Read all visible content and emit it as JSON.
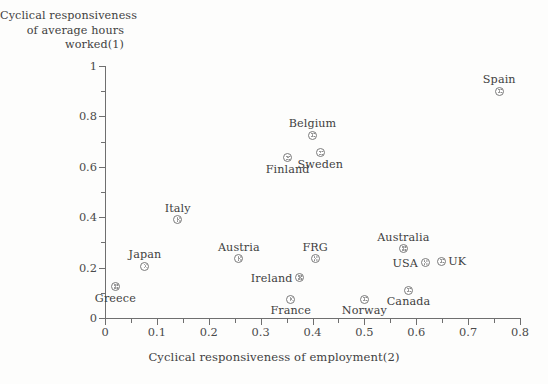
{
  "chart_data": {
    "type": "scatter",
    "title": "",
    "ylabel_lines": [
      "Cyclical responsiveness",
      "of average hours",
      "worked(1)"
    ],
    "xlabel": "Cyclical responsiveness of employment(2)",
    "xlim": [
      0,
      0.8
    ],
    "ylim": [
      0,
      1
    ],
    "xticks": [
      0,
      0.1,
      0.2,
      0.3,
      0.4,
      0.5,
      0.6,
      0.7,
      0.8
    ],
    "xtick_labels": [
      "0",
      "0.1",
      "0.2",
      "0.3",
      "0.4",
      "0.5",
      "0.6",
      "0.7",
      "0.8"
    ],
    "yticks": [
      0,
      0.2,
      0.4,
      0.6,
      0.8,
      1
    ],
    "ytick_labels": [
      "0",
      "0.2",
      "0.4",
      "0.6",
      "0.8",
      "1"
    ],
    "x_minor_ticks": [
      0.05,
      0.15,
      0.25,
      0.35,
      0.45,
      0.55,
      0.65,
      0.75
    ],
    "y_minor_ticks": [
      0.1,
      0.3,
      0.5,
      0.7,
      0.9
    ],
    "grid": false,
    "legend": false,
    "marker_style": "circle-with-dots",
    "points": [
      {
        "label": "Spain",
        "x": 0.76,
        "y": 0.9,
        "label_pos": "above"
      },
      {
        "label": "Belgium",
        "x": 0.4,
        "y": 0.725,
        "label_pos": "above"
      },
      {
        "label": "Sweden",
        "x": 0.415,
        "y": 0.655,
        "label_pos": "below"
      },
      {
        "label": "Finland",
        "x": 0.352,
        "y": 0.635,
        "label_pos": "below"
      },
      {
        "label": "Italy",
        "x": 0.14,
        "y": 0.39,
        "label_pos": "above"
      },
      {
        "label": "Australia",
        "x": 0.575,
        "y": 0.275,
        "label_pos": "above"
      },
      {
        "label": "Austria",
        "x": 0.258,
        "y": 0.235,
        "label_pos": "above"
      },
      {
        "label": "FRG",
        "x": 0.405,
        "y": 0.235,
        "label_pos": "above"
      },
      {
        "label": "UK",
        "x": 0.648,
        "y": 0.225,
        "label_pos": "right"
      },
      {
        "label": "USA",
        "x": 0.617,
        "y": 0.22,
        "label_pos": "left"
      },
      {
        "label": "Japan",
        "x": 0.077,
        "y": 0.205,
        "label_pos": "above"
      },
      {
        "label": "Ireland",
        "x": 0.375,
        "y": 0.16,
        "label_pos": "left"
      },
      {
        "label": "Greece",
        "x": 0.02,
        "y": 0.125,
        "label_pos": "below"
      },
      {
        "label": "Canada",
        "x": 0.585,
        "y": 0.11,
        "label_pos": "below"
      },
      {
        "label": "France",
        "x": 0.358,
        "y": 0.075,
        "label_pos": "below"
      },
      {
        "label": "Norway",
        "x": 0.5,
        "y": 0.075,
        "label_pos": "below"
      }
    ]
  },
  "colors": {
    "background": "#fdfdfc",
    "axis": "#6f6f6f",
    "text": "#3f3f3f",
    "marker_stroke": "#7a7a7a"
  }
}
